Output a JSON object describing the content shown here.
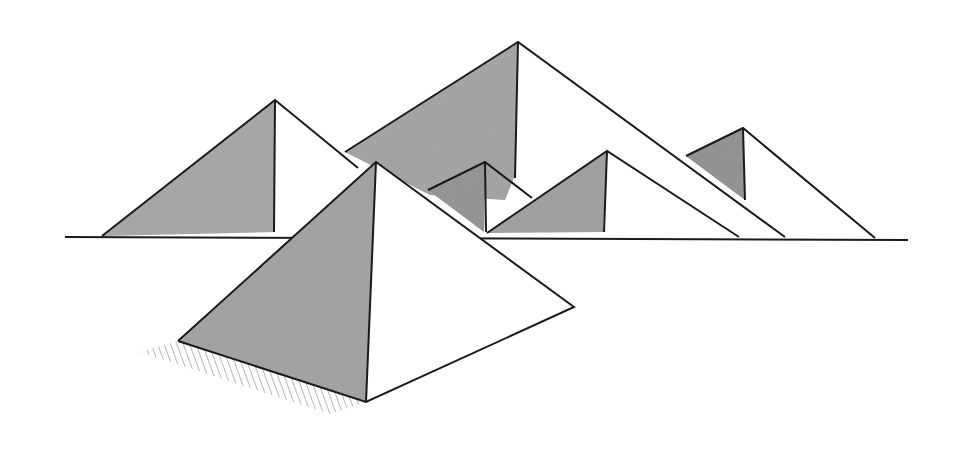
{
  "image": {
    "subject": "Pencil sketch of pyramids",
    "style": "graphite drawing on white paper",
    "background_color": "#ffffff",
    "line_color": "#1a1a1a",
    "shade_color": "#9a9a9a",
    "pyramid_count": 6
  }
}
